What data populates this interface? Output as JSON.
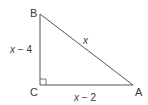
{
  "diagram": {
    "type": "right-triangle",
    "vertices": [
      {
        "name": "B",
        "label": "B"
      },
      {
        "name": "C",
        "label": "C"
      },
      {
        "name": "A",
        "label": "A"
      }
    ],
    "sides": {
      "BC": {
        "var": "x",
        "op": " − ",
        "num": "4"
      },
      "CA": {
        "var": "x",
        "op": " − ",
        "num": "2"
      },
      "AB": {
        "var": "x"
      }
    },
    "right_angle_at": "C",
    "colors": {
      "stroke": "#555555",
      "text": "#3a3a3a"
    }
  }
}
